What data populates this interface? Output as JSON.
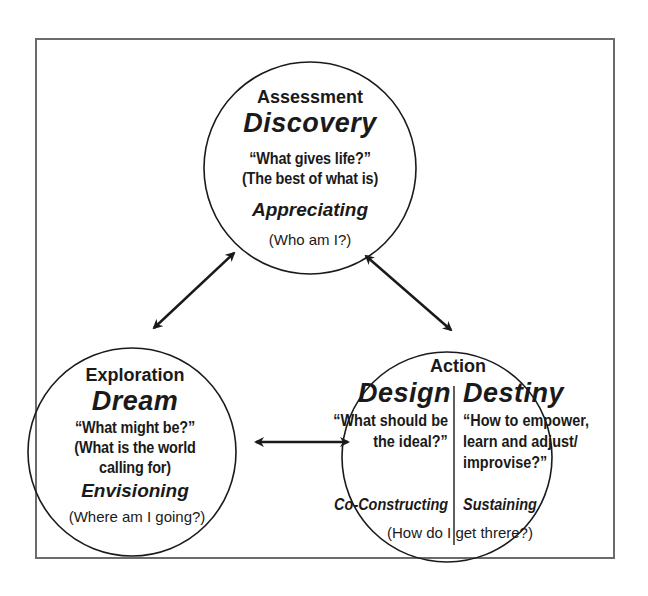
{
  "diagram": {
    "top_node": {
      "phase": "Assessment",
      "title": "Discovery",
      "question_line1": "“What gives life?”",
      "question_line2": "(The best of what is)",
      "verb": "Appreciating",
      "reflection": "(Who am I?)"
    },
    "left_node": {
      "phase": "Exploration",
      "title": "Dream",
      "question_line1": "“What might be?”",
      "question_line2": "(What is the world",
      "question_line3": "calling for)",
      "verb": "Envisioning",
      "reflection": "(Where am I going?)"
    },
    "right_node": {
      "phase": "Action",
      "left_half": {
        "title": "Design",
        "question_line1": "“What should be",
        "question_line2": "the ideal?”",
        "verb": "Co-Constructing"
      },
      "right_half": {
        "title": "Destiny",
        "question_line1": "“How to empower,",
        "question_line2": "learn and adjust/",
        "question_line3": "improvise?”",
        "verb": "Sustaining"
      },
      "reflection": "(How do I get threre?)"
    },
    "connectors": [
      {
        "from": "top_node",
        "to": "left_node",
        "type": "bidirectional-arrow"
      },
      {
        "from": "top_node",
        "to": "right_node",
        "type": "bidirectional-arrow"
      },
      {
        "from": "left_node",
        "to": "right_node",
        "type": "bidirectional-arrow"
      }
    ],
    "colors": {
      "stroke": "#1a1a1a",
      "frame": "#6b6b6b",
      "background": "#ffffff"
    }
  }
}
